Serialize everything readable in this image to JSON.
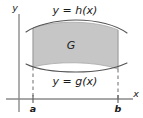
{
  "figure": {
    "type": "math-region-diagram",
    "axes": {
      "y_axis_label": "y",
      "x_axis_label": "x",
      "axis_color": "#808080"
    },
    "curves": {
      "upper": {
        "label": "y = h(x)",
        "name": "h",
        "shape": "concave-down-arc"
      },
      "lower": {
        "label": "y = g(x)",
        "name": "g",
        "shape": "concave-up-arc"
      },
      "curve_color": "#4d4d4d"
    },
    "region": {
      "label": "G",
      "fill_color": "#c6c6c6",
      "edge_color": "#999999"
    },
    "ticks": [
      {
        "label": "a",
        "position": "left"
      },
      {
        "label": "b",
        "position": "right"
      }
    ],
    "guides": {
      "style": "dashed",
      "color": "#666666"
    }
  }
}
